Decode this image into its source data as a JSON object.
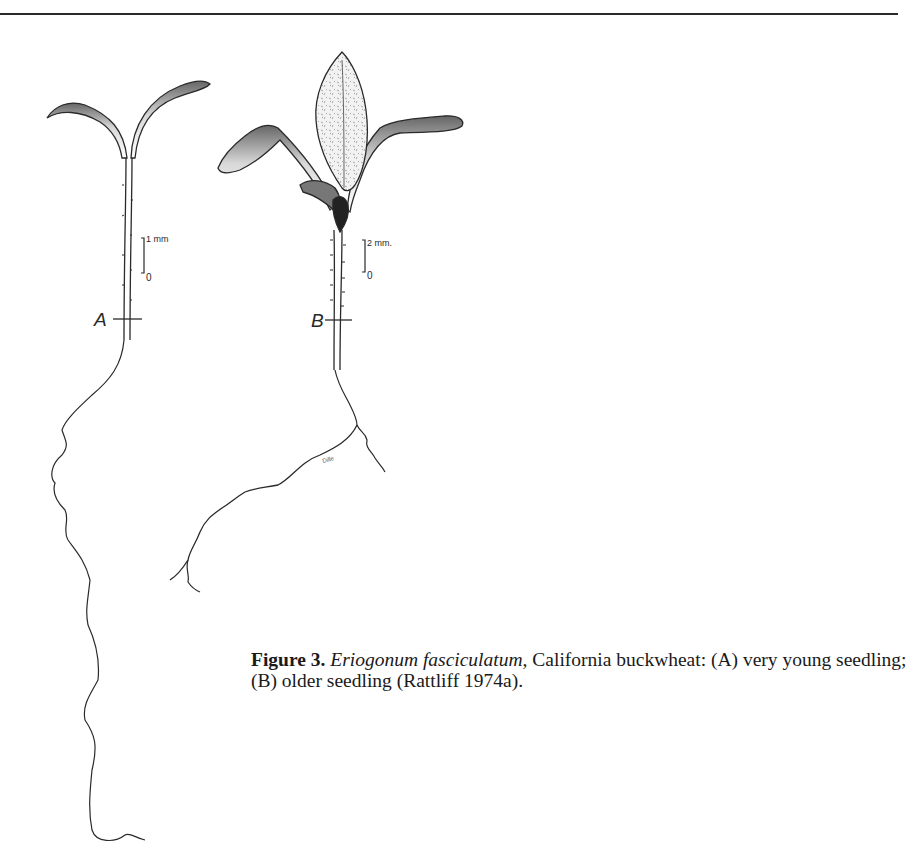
{
  "page": {
    "running_head": "Eriogonum, Syn. Spec. Seedl.",
    "running_head_visible": "truncated at top edge"
  },
  "figure": {
    "panels": [
      {
        "id": "A",
        "label": "A",
        "scale_top": "1 mm",
        "scale_bottom": "0",
        "description": "very young seedling with two cotyledons"
      },
      {
        "id": "B",
        "label": "B",
        "scale_top": "2 mm.",
        "scale_bottom": "0",
        "description": "older seedling with first true leaf"
      }
    ],
    "artist_signature": "Dille"
  },
  "caption": {
    "fig_label": "Figure 3.",
    "species": "Eriogonum fasciculatum,",
    "text": " California buckwheat: (A) very young seedling; (B) older seedling (Rattliff 1974a)."
  }
}
